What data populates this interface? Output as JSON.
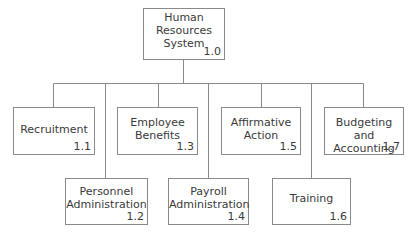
{
  "diagram": {
    "type": "hierarchy-chart",
    "root": {
      "id": "1.0",
      "label": "Human\nResources\nSystem"
    },
    "children": [
      {
        "id": "1.1",
        "label": "Recruitment"
      },
      {
        "id": "1.2",
        "label": "Personnel\nAdministration"
      },
      {
        "id": "1.3",
        "label": "Employee\nBenefits"
      },
      {
        "id": "1.4",
        "label": "Payroll\nAdministration"
      },
      {
        "id": "1.5",
        "label": "Affirmative\nAction"
      },
      {
        "id": "1.6",
        "label": "Training"
      },
      {
        "id": "1.7",
        "label": "Budgeting and\nAccounting"
      }
    ],
    "colors": {
      "line": "#8a8a8a",
      "text": "#3a3a3a",
      "background": "#ffffff"
    }
  }
}
